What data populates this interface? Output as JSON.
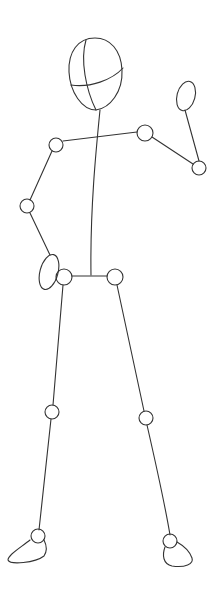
{
  "stroke_color": "#333333",
  "background": "#ffffff",
  "parts": {
    "head": {
      "cx": 95,
      "cy": 74,
      "rx": 26,
      "ry": 37
    },
    "joints": [
      {
        "name": "left-shoulder",
        "cx": 56,
        "cy": 145,
        "r": 7
      },
      {
        "name": "right-shoulder",
        "cx": 145,
        "cy": 133,
        "r": 8
      },
      {
        "name": "right-elbow",
        "cx": 199,
        "cy": 168,
        "r": 7
      },
      {
        "name": "left-elbow",
        "cx": 27,
        "cy": 206,
        "r": 7
      },
      {
        "name": "left-hip",
        "cx": 64,
        "cy": 277,
        "r": 8
      },
      {
        "name": "right-hip",
        "cx": 115,
        "cy": 277,
        "r": 8
      },
      {
        "name": "left-knee",
        "cx": 52,
        "cy": 412,
        "r": 7
      },
      {
        "name": "right-knee",
        "cx": 146,
        "cy": 418,
        "r": 7
      },
      {
        "name": "left-ankle",
        "cx": 38,
        "cy": 536,
        "r": 7
      },
      {
        "name": "right-ankle",
        "cx": 170,
        "cy": 541,
        "r": 7
      }
    ]
  }
}
